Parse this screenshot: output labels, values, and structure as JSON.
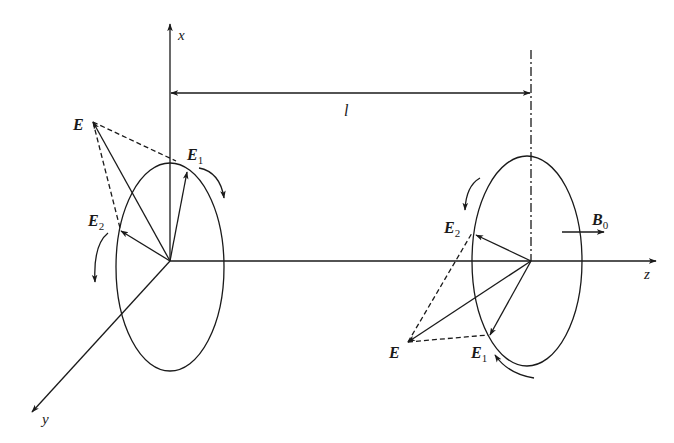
{
  "figure": {
    "axes": {
      "x_label": "x",
      "y_label": "y",
      "z_label": "z"
    },
    "distance_label": "l",
    "field_label": "B",
    "field_sub": "0",
    "left_plane": {
      "resultant": "E",
      "component1": "E",
      "component1_sub": "1",
      "component2": "E",
      "component2_sub": "2"
    },
    "right_plane": {
      "resultant": "E",
      "component1": "E",
      "component1_sub": "1",
      "component2": "E",
      "component2_sub": "2"
    }
  },
  "colors": {
    "stroke": "#1a1a1a",
    "background": "#ffffff"
  }
}
